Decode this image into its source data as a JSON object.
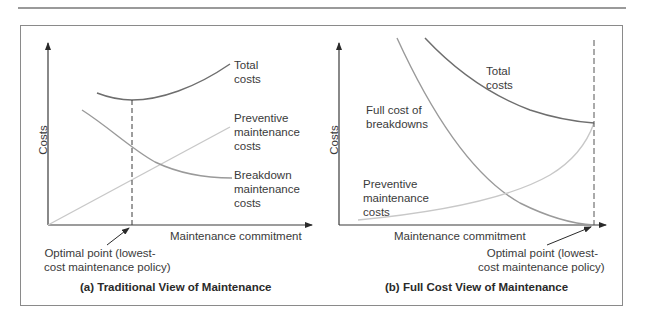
{
  "figure": {
    "panels": [
      {
        "id": "a",
        "caption": "(a) Traditional View of Maintenance",
        "y_axis_label": "Costs",
        "x_axis_label": "Maintenance commitment",
        "curves": {
          "total": [
            "Total",
            "costs"
          ],
          "preventive": [
            "Preventive",
            "maintenance",
            "costs"
          ],
          "breakdown": [
            "Breakdown",
            "maintenance",
            "costs"
          ]
        },
        "optimal_label": [
          "Optimal point (lowest-",
          "cost maintenance policy)"
        ]
      },
      {
        "id": "b",
        "caption": "(b) Full Cost View of Maintenance",
        "y_axis_label": "Costs",
        "x_axis_label": "Maintenance commitment",
        "curves": {
          "total": [
            "Total",
            "costs"
          ],
          "breakdown": [
            "Full cost of",
            "breakdowns"
          ],
          "preventive": [
            "Preventive",
            "maintenance",
            "costs"
          ]
        },
        "optimal_label": [
          "Optimal point (lowest-",
          "cost maintenance policy)"
        ]
      }
    ],
    "colors": {
      "axis": "#3a3a3a",
      "total_curve": "#6e6e6e",
      "breakdown_curve": "#9a9a9a",
      "preventive_curve": "#c8c8c8",
      "frame": "#8a8a8a"
    }
  }
}
